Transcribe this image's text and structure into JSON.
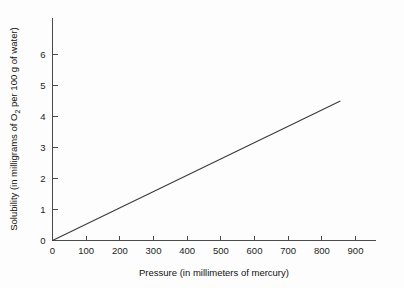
{
  "chart_data": {
    "type": "line",
    "title": "",
    "xlabel": "Pressure (in millimeters of mercury)",
    "ylabel_parts": {
      "before": "Solubility (in milligrams of O",
      "subscript": "2",
      "after": " per 100 g of water)"
    },
    "ylabel": "Solubility (in milligrams of O2 per 100 g of water)",
    "xlim": [
      0,
      970
    ],
    "ylim": [
      0,
      6.7
    ],
    "xticks": [
      0,
      100,
      200,
      300,
      400,
      500,
      600,
      700,
      800,
      900
    ],
    "xtick_labels": [
      "0",
      "100",
      "200",
      "300",
      "400",
      "500",
      "600",
      "700",
      "800",
      "900"
    ],
    "yticks": [
      0,
      1,
      2,
      3,
      4,
      5,
      6
    ],
    "ytick_labels": [
      "0",
      "1",
      "2",
      "3",
      "4",
      "5",
      "6"
    ],
    "grid": false,
    "legend": false,
    "series": [
      {
        "name": "Solubility of oxygen vs pressure",
        "x": [
          0,
          855
        ],
        "values": [
          0,
          4.5
        ],
        "color": "#3b3b3b"
      }
    ],
    "colors": {
      "axis": "#4a4a4a",
      "line": "#3b3b3b",
      "text": "#111111",
      "background": "#fdfdfd"
    }
  }
}
